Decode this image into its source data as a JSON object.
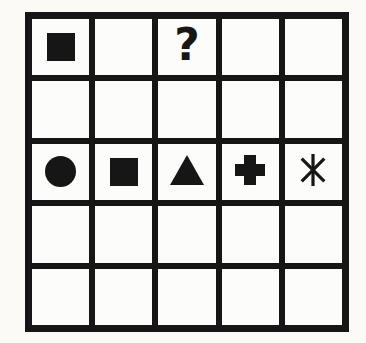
{
  "figure": {
    "rows": 5,
    "cols": 5
  },
  "grid": {
    "cells": [
      [
        "filled-square",
        "",
        "question-mark",
        "",
        ""
      ],
      [
        "",
        "",
        "",
        "",
        ""
      ],
      [
        "filled-circle",
        "filled-square",
        "filled-triangle",
        "bold-plus",
        "asterisk"
      ],
      [
        "",
        "",
        "",
        "",
        ""
      ],
      [
        "",
        "",
        "",
        "",
        ""
      ]
    ]
  },
  "symbols": {
    "question_mark_glyph": "?"
  },
  "colors": {
    "ink": "#161616",
    "paper": "#fbfaf7",
    "cell": "#fcfcfb"
  }
}
